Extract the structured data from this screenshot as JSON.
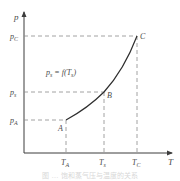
{
  "diagram": {
    "type": "phase-curve",
    "axes": {
      "y_label": "p",
      "x_label": "T"
    },
    "equation": {
      "lhs": "p",
      "lhs_sub": "s",
      "mid": " = f(T",
      "arg_sub": "s",
      "tail": ")"
    },
    "points": [
      {
        "name": "A",
        "p_label": "p",
        "p_sub": "A",
        "T_label": "T",
        "T_sub": "A"
      },
      {
        "name": "B",
        "p_label": "p",
        "p_sub": "s",
        "T_label": "T",
        "T_sub": "s"
      },
      {
        "name": "C",
        "p_label": "p",
        "p_sub": "C",
        "T_label": "T",
        "T_sub": "C"
      }
    ],
    "colors": {
      "axis": "#3c3c3c",
      "curve": "#2e2e2e",
      "dash": "#8a8a8a"
    }
  },
  "caption": "图 … 饱和蒸气压与温度的关系"
}
